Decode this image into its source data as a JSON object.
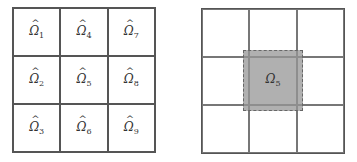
{
  "left_grid": {
    "description": "3x3 subdomain partition",
    "cells": [
      {
        "symbol": "Ω",
        "hat": "^",
        "index": "1"
      },
      {
        "symbol": "Ω",
        "hat": "^",
        "index": "4"
      },
      {
        "symbol": "Ω",
        "hat": "^",
        "index": "7"
      },
      {
        "symbol": "Ω",
        "hat": "^",
        "index": "2"
      },
      {
        "symbol": "Ω",
        "hat": "^",
        "index": "5"
      },
      {
        "symbol": "Ω",
        "hat": "^",
        "index": "8"
      },
      {
        "symbol": "Ω",
        "hat": "^",
        "index": "3"
      },
      {
        "symbol": "Ω",
        "hat": "^",
        "index": "6"
      },
      {
        "symbol": "Ω",
        "hat": "^",
        "index": "9"
      }
    ]
  },
  "right_grid": {
    "description": "3x3 grid with overlapping center subdomain",
    "highlight": {
      "symbol": "Ω",
      "index": "5",
      "fill": "#969696",
      "border": "dashed"
    }
  }
}
